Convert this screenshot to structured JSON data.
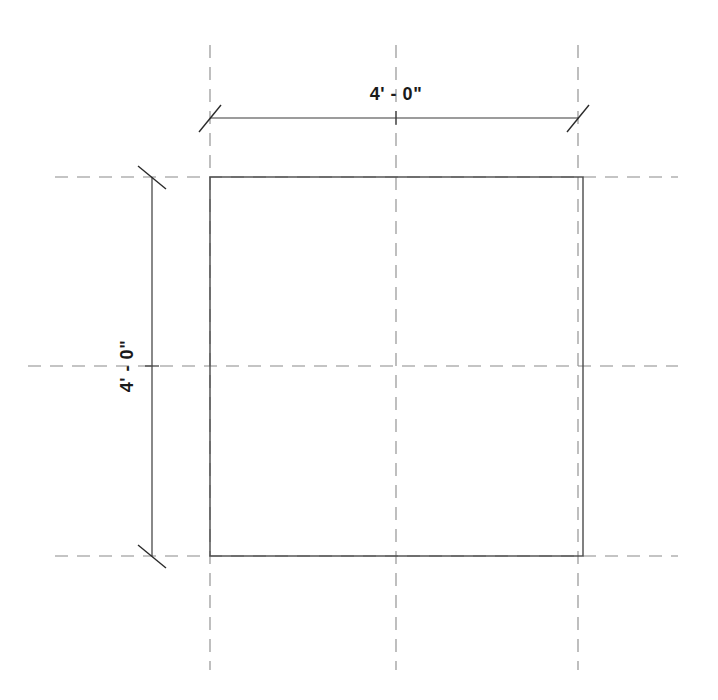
{
  "drawing": {
    "title": "square-plan-dimensioned",
    "background_color": "#ffffff",
    "line_color": "#4a4a4a",
    "grid_color": "#808080",
    "dim_color": "#3a3a3a",
    "text_color": "#1a1a1a",
    "shape": {
      "name": "square",
      "left": 210,
      "top": 177,
      "right": 583,
      "bottom": 556,
      "width_px": 373,
      "height_px": 379
    },
    "dimensions": {
      "horizontal": {
        "label": "4' - 0\"",
        "value_feet": 4,
        "value_inches": 0,
        "orientation": "horizontal",
        "line_y": 118,
        "start_x": 210,
        "end_x": 578,
        "text_x": 396,
        "text_y": 100
      },
      "vertical": {
        "label": "4' - 0\"",
        "value_feet": 4,
        "value_inches": 0,
        "orientation": "vertical",
        "line_x": 152,
        "start_y": 177,
        "end_y": 556,
        "text_x": 133,
        "text_y": 366,
        "rotation_deg": -90
      }
    },
    "grid": {
      "vertical_lines": [
        {
          "name": "grid-line-left",
          "x": 210,
          "y1": 45,
          "y2": 670
        },
        {
          "name": "grid-line-center-vertical",
          "x": 396,
          "y1": 45,
          "y2": 670
        },
        {
          "name": "grid-line-right",
          "x": 578,
          "y1": 45,
          "y2": 670
        }
      ],
      "horizontal_lines": [
        {
          "name": "grid-line-top",
          "y": 177,
          "x1": 55,
          "x2": 678
        },
        {
          "name": "grid-line-center-horizontal",
          "y": 366,
          "x1": 28,
          "x2": 678
        },
        {
          "name": "grid-line-bottom",
          "y": 556,
          "x1": 55,
          "x2": 678
        }
      ],
      "dash_pattern": "13 9"
    },
    "tick_marks": [
      {
        "name": "tick-dim-horizontal-left",
        "cx": 210,
        "cy": 118
      },
      {
        "name": "tick-dim-horizontal-right",
        "cx": 578,
        "cy": 118
      },
      {
        "name": "tick-dim-vertical-top",
        "cx": 152,
        "cy": 177
      },
      {
        "name": "tick-dim-vertical-bottom",
        "cx": 152,
        "cy": 556
      }
    ]
  }
}
